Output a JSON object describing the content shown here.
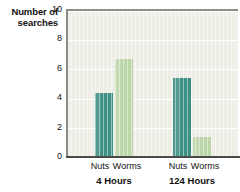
{
  "chart_data": {
    "type": "bar",
    "title": "",
    "xlabel": "",
    "ylabel": "Number of searches",
    "ylabel_line1": "Number of",
    "ylabel_line2": "searches",
    "ylim": [
      0,
      10
    ],
    "yticks": [
      0,
      2,
      4,
      6,
      8,
      10
    ],
    "ytick_labels": [
      "0",
      "2",
      "4",
      "6",
      "8",
      "10"
    ],
    "grid": true,
    "grid_axis": "y",
    "legend": false,
    "categories": [
      "Nuts",
      "Worms"
    ],
    "groups": [
      {
        "label": "4 Hours",
        "values": [
          4.4,
          6.7
        ]
      },
      {
        "label": "124 Hours",
        "values": [
          5.4,
          1.4
        ]
      }
    ],
    "series": [
      {
        "name": "Nuts",
        "color": "#3e8f84",
        "values": [
          4.4,
          5.4
        ]
      },
      {
        "name": "Worms",
        "color": "#bdd6a9",
        "values": [
          6.7,
          1.4
        ]
      }
    ],
    "bars": [
      {
        "group": "4 Hours",
        "category": "Nuts",
        "value": 4.4,
        "color": "#3e8f84"
      },
      {
        "group": "4 Hours",
        "category": "Worms",
        "value": 6.7,
        "color": "#bdd6a9"
      },
      {
        "group": "124 Hours",
        "category": "Nuts",
        "value": 5.4,
        "color": "#3e8f84"
      },
      {
        "group": "124 Hours",
        "category": "Worms",
        "value": 1.4,
        "color": "#bdd6a9"
      }
    ],
    "colors": {
      "nuts_bar": "#3e8f84",
      "worms_bar": "#bdd6a9",
      "plot_background": "#eeeee7",
      "gridline": "#ffffff",
      "axis": "#8d8d86",
      "baseline": "#4a4a45",
      "page_background": "#ffffff",
      "text": "#111111"
    }
  },
  "labels": {
    "cat_g1_nuts": "Nuts",
    "cat_g1_worms": "Worms",
    "cat_g2_nuts": "Nuts",
    "cat_g2_worms": "Worms",
    "group1": "4 Hours",
    "group2": "124 Hours",
    "ytick_0": "0",
    "ytick_2": "2",
    "ytick_4": "4",
    "ytick_6": "6",
    "ytick_8": "8",
    "ytick_10": "10"
  }
}
